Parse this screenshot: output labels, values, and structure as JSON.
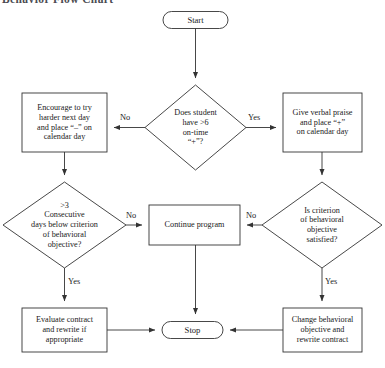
{
  "figure": {
    "title_cropped": "Behavior Flow Chart",
    "background_color": "#ffffff",
    "stroke_color": "#333333",
    "text_color": "#1a1a1a"
  },
  "nodes": {
    "start": {
      "label": "Start",
      "shape": "terminal"
    },
    "decision_on_time": {
      "label": "Does student\nhave >6\non-time\n“+”?",
      "shape": "diamond"
    },
    "encourage": {
      "label": "Encourage to try\nharder next day\nand place “–” on\ncalendar day",
      "shape": "box"
    },
    "praise": {
      "label": "Give verbal praise\nand place “+”\non calendar day",
      "shape": "box"
    },
    "decision_consecutive": {
      "label": ">3\nConsecutive\ndays below criterion\nof behavioral\nobjective?",
      "shape": "diamond"
    },
    "continue_program": {
      "label": "Continue program",
      "shape": "box"
    },
    "decision_criterion": {
      "label": "Is criterion\nof behavioral\nobjective\nsatisfied?",
      "shape": "diamond"
    },
    "evaluate_contract": {
      "label": "Evaluate contract\nand rewrite if\nappropriate",
      "shape": "box"
    },
    "stop": {
      "label": "Stop",
      "shape": "terminal"
    },
    "change_objective": {
      "label": "Change behavioral\nobjective and\nrewrite contract",
      "shape": "box"
    }
  },
  "edge_labels": {
    "no_left_top": "No",
    "yes_right_top": "Yes",
    "no_left_mid": "No",
    "no_right_mid": "No",
    "yes_left_bottom": "Yes",
    "yes_right_bottom": "Yes"
  }
}
